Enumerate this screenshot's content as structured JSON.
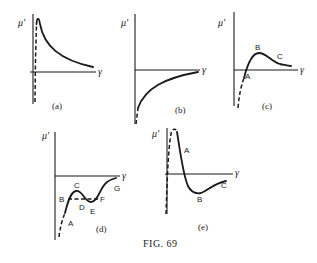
{
  "figure": {
    "caption": "FIG. 69",
    "y_axis_symbol": "μ'",
    "x_axis_symbol": "γ",
    "panels": [
      {
        "id": "a",
        "label": "(a)",
        "points": []
      },
      {
        "id": "b",
        "label": "(b)",
        "points": []
      },
      {
        "id": "c",
        "label": "(c)",
        "points": [
          "A",
          "B",
          "C"
        ]
      },
      {
        "id": "d",
        "label": "(d)",
        "points": [
          "A",
          "B",
          "C",
          "D",
          "E",
          "F",
          "G"
        ]
      },
      {
        "id": "e",
        "label": "(e)",
        "points": [
          "A",
          "B",
          "C"
        ]
      }
    ]
  },
  "colors": {
    "ink": "#1a1a1a",
    "background": "#ffffff"
  }
}
